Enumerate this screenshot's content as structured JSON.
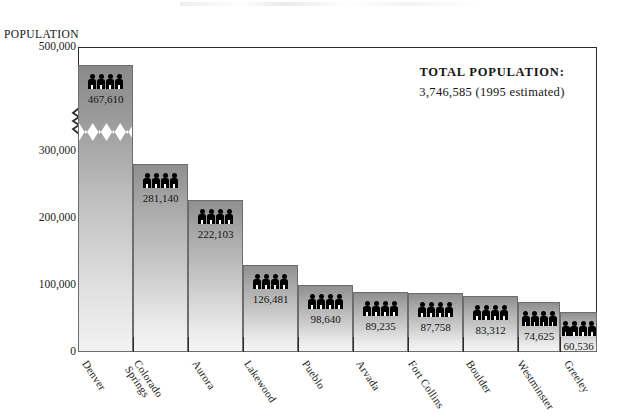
{
  "chart_data": {
    "type": "bar",
    "title": "",
    "xlabel": "",
    "ylabel": "POPULATION",
    "ylim": [
      0,
      500000
    ],
    "yticks": [
      "0",
      "100,000",
      "200,000",
      "300,000",
      "500,000"
    ],
    "ytick_values": [
      0,
      100000,
      200000,
      300000,
      500000
    ],
    "axis_break": {
      "present": true,
      "between": [
        300000,
        500000
      ],
      "note": "zigzag break on y-axis and across the Denver bar"
    },
    "grid": false,
    "legend": "none",
    "categories": [
      "Denver",
      "Colorado Springs",
      "Aurora",
      "Lakewood",
      "Pueblo",
      "Arvada",
      "Fort Collins",
      "Boulder",
      "Westminster",
      "Greeley"
    ],
    "values": [
      467610,
      281140,
      222103,
      126481,
      98640,
      89235,
      87758,
      83312,
      74625,
      60536
    ],
    "data_labels": [
      "467,610",
      "281,140",
      "222,103",
      "126,481",
      "98,640",
      "89,235",
      "87,758",
      "83,312",
      "74,625",
      "60,536"
    ],
    "annotations": {
      "total_label": "TOTAL POPULATION:",
      "total_value": "3,746,585 (1995 estimated)"
    },
    "bar_icon": "people-icon",
    "colors": {
      "bar_top": "#8f8f8f",
      "bar_bottom": "#f4f4f4",
      "bar_border": "#6d6d6d",
      "axis": "#2b2b2b",
      "text": "#141414"
    }
  },
  "axis": {
    "y_title": "POPULATION",
    "ticks": [
      {
        "label": "500,000",
        "top": 47
      },
      {
        "label": "300,000",
        "top": 151
      },
      {
        "label": "200,000",
        "top": 218
      },
      {
        "label": "100,000",
        "top": 285
      },
      {
        "label": "0",
        "top": 352
      }
    ]
  },
  "bars": [
    {
      "name": "Denver",
      "label": "467,610",
      "left": 78,
      "width": 55,
      "top": 65,
      "tall": true
    },
    {
      "name": "Colorado Springs",
      "label": "281,140",
      "left": 133,
      "width": 55,
      "top": 164,
      "tall": false
    },
    {
      "name": "Aurora",
      "label": "222,103",
      "left": 188,
      "width": 55,
      "top": 200,
      "tall": false
    },
    {
      "name": "Lakewood",
      "label": "126,481",
      "left": 243,
      "width": 55,
      "top": 265,
      "tall": false
    },
    {
      "name": "Pueblo",
      "label": "98,640",
      "left": 298,
      "width": 55,
      "top": 285,
      "tall": false
    },
    {
      "name": "Arvada",
      "label": "89,235",
      "left": 353,
      "width": 55,
      "top": 292,
      "tall": false
    },
    {
      "name": "Fort Collins",
      "label": "87,758",
      "left": 408,
      "width": 55,
      "top": 293,
      "tall": false
    },
    {
      "name": "Boulder",
      "label": "83,312",
      "left": 463,
      "width": 55,
      "top": 296,
      "tall": false
    },
    {
      "name": "Westminster",
      "label": "74,625",
      "left": 518,
      "width": 42,
      "top": 302,
      "tall": false
    },
    {
      "name": "Greeley",
      "label": "60,536",
      "left": 560,
      "width": 37,
      "top": 312,
      "tall": false
    }
  ],
  "xlabels": [
    {
      "lines": [
        "Denver"
      ],
      "left": 90,
      "top": 358
    },
    {
      "lines": [
        "Colorado",
        "Springs"
      ],
      "left": 141,
      "top": 358
    },
    {
      "lines": [
        "Aurora"
      ],
      "left": 200,
      "top": 358
    },
    {
      "lines": [
        "Lakewood"
      ],
      "left": 252,
      "top": 358
    },
    {
      "lines": [
        "Pueblo"
      ],
      "left": 310,
      "top": 358
    },
    {
      "lines": [
        "Arvada"
      ],
      "left": 364,
      "top": 358
    },
    {
      "lines": [
        "Fort Collins"
      ],
      "left": 416,
      "top": 358
    },
    {
      "lines": [
        "Boulder"
      ],
      "left": 474,
      "top": 358
    },
    {
      "lines": [
        "Westminster"
      ],
      "left": 525,
      "top": 358
    },
    {
      "lines": [
        "Greeley"
      ],
      "left": 572,
      "top": 358
    }
  ],
  "separators": [
    133,
    188,
    243,
    298,
    353,
    408,
    463,
    518,
    560
  ],
  "total": {
    "label": "TOTAL POPULATION:",
    "value": "3,746,585 (1995 estimated)"
  }
}
